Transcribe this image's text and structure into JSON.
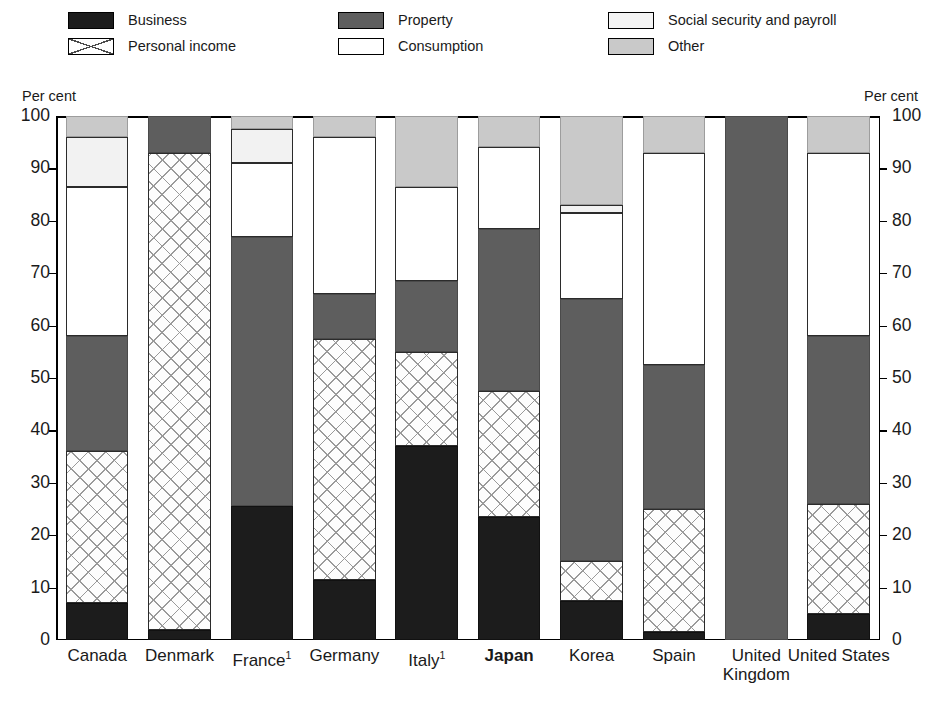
{
  "axis": {
    "left_caption": "Per cent",
    "right_caption": "Per cent",
    "ticks": [
      "0",
      "10",
      "20",
      "30",
      "40",
      "50",
      "60",
      "70",
      "80",
      "90",
      "100"
    ]
  },
  "legend": {
    "columns": [
      [
        {
          "key": "business",
          "label": "Business",
          "swatch": "solid-black"
        },
        {
          "key": "personal",
          "label": "Personal income",
          "swatch": "white-crosshatch"
        }
      ],
      [
        {
          "key": "property",
          "label": "Property",
          "swatch": "dark-gray"
        },
        {
          "key": "consumption",
          "label": "Consumption",
          "swatch": "white"
        }
      ],
      [
        {
          "key": "social",
          "label": "Social security and payroll",
          "swatch": "very-light-gray"
        },
        {
          "key": "other",
          "label": "Other",
          "swatch": "light-gray"
        }
      ]
    ]
  },
  "colors": {
    "business": "#1c1c1c",
    "personal": "#ffffff",
    "property": "#5e5e5e",
    "consumption": "#ffffff",
    "social": "#f2f2f2",
    "other": "#c9c9c9"
  },
  "chart_data": {
    "type": "bar",
    "stacked": true,
    "title": "",
    "xlabel": "",
    "ylabel": "Per cent",
    "ylim": [
      0,
      100
    ],
    "yticks": [
      0,
      10,
      20,
      30,
      40,
      50,
      60,
      70,
      80,
      90,
      100
    ],
    "grid": false,
    "legend_position": "top",
    "categories": [
      "Canada",
      "Denmark",
      "France",
      "Germany",
      "Italy",
      "Japan",
      "Korea",
      "Spain",
      "United Kingdom",
      "United States"
    ],
    "category_labels": [
      {
        "text": "Canada",
        "footnote": "",
        "bold": false,
        "lines": [
          "Canada"
        ]
      },
      {
        "text": "Denmark",
        "footnote": "",
        "bold": false,
        "lines": [
          "Denmark"
        ]
      },
      {
        "text": "France",
        "footnote": "1",
        "bold": false,
        "lines": [
          "France"
        ]
      },
      {
        "text": "Germany",
        "footnote": "",
        "bold": false,
        "lines": [
          "Germany"
        ]
      },
      {
        "text": "Italy",
        "footnote": "1",
        "bold": false,
        "lines": [
          "Italy"
        ]
      },
      {
        "text": "Japan",
        "footnote": "",
        "bold": true,
        "lines": [
          "Japan"
        ]
      },
      {
        "text": "Korea",
        "footnote": "",
        "bold": false,
        "lines": [
          "Korea"
        ]
      },
      {
        "text": "Spain",
        "footnote": "",
        "bold": false,
        "lines": [
          "Spain"
        ]
      },
      {
        "text": "United Kingdom",
        "footnote": "",
        "bold": false,
        "lines": [
          "United",
          "Kingdom"
        ]
      },
      {
        "text": "United States",
        "footnote": "",
        "bold": false,
        "lines": [
          "United States"
        ]
      }
    ],
    "series": [
      {
        "name": "Business",
        "key": "business",
        "values": [
          7.0,
          2.0,
          25.5,
          11.5,
          37.0,
          23.5,
          7.5,
          1.5,
          0.0,
          5.0
        ]
      },
      {
        "name": "Personal income",
        "key": "personal",
        "values": [
          29.0,
          91.0,
          0.0,
          46.0,
          18.0,
          24.0,
          7.5,
          23.5,
          0.0,
          21.0
        ]
      },
      {
        "name": "Property",
        "key": "property",
        "values": [
          22.0,
          7.0,
          51.5,
          8.5,
          13.5,
          31.0,
          50.0,
          27.5,
          100.0,
          32.0
        ]
      },
      {
        "name": "Consumption",
        "key": "consumption",
        "values": [
          28.5,
          0.0,
          14.0,
          30.0,
          18.0,
          15.5,
          16.5,
          40.5,
          0.0,
          35.0
        ]
      },
      {
        "name": "Social security and payroll",
        "key": "social",
        "values": [
          9.5,
          0.0,
          6.5,
          0.0,
          0.0,
          0.0,
          1.5,
          0.0,
          0.0,
          0.0
        ]
      },
      {
        "name": "Other",
        "key": "other",
        "values": [
          4.0,
          0.0,
          2.5,
          4.0,
          13.5,
          6.0,
          17.0,
          7.0,
          0.0,
          7.0
        ]
      }
    ],
    "cumulative_tops": {
      "Canada": {
        "business": 7.0,
        "personal": 36.0,
        "property": 58.0,
        "consumption": 86.5,
        "social": 96.0,
        "other": 100.0
      },
      "Denmark": {
        "business": 2.0,
        "personal": 93.0,
        "property": 100.0,
        "consumption": 100.0,
        "social": 100.0,
        "other": 100.0
      },
      "France": {
        "business": 25.5,
        "personal": 25.5,
        "property": 77.0,
        "consumption": 91.0,
        "social": 97.5,
        "other": 100.0
      },
      "Germany": {
        "business": 11.5,
        "personal": 57.5,
        "property": 66.0,
        "consumption": 96.0,
        "social": 96.0,
        "other": 100.0
      },
      "Italy": {
        "business": 37.0,
        "personal": 55.0,
        "property": 68.5,
        "consumption": 86.5,
        "social": 86.5,
        "other": 100.0
      },
      "Japan": {
        "business": 23.5,
        "personal": 47.5,
        "property": 78.5,
        "consumption": 94.0,
        "social": 94.0,
        "other": 100.0
      },
      "Korea": {
        "business": 7.5,
        "personal": 15.0,
        "property": 65.0,
        "consumption": 81.5,
        "social": 83.0,
        "other": 100.0
      },
      "Spain": {
        "business": 1.5,
        "personal": 25.0,
        "property": 52.5,
        "consumption": 93.0,
        "social": 93.0,
        "other": 100.0
      },
      "United Kingdom": {
        "business": 0.0,
        "personal": 0.0,
        "property": 100.0,
        "consumption": 100.0,
        "social": 100.0,
        "other": 100.0
      },
      "United States": {
        "business": 5.0,
        "personal": 26.0,
        "property": 58.0,
        "consumption": 93.0,
        "social": 93.0,
        "other": 100.0
      }
    }
  }
}
